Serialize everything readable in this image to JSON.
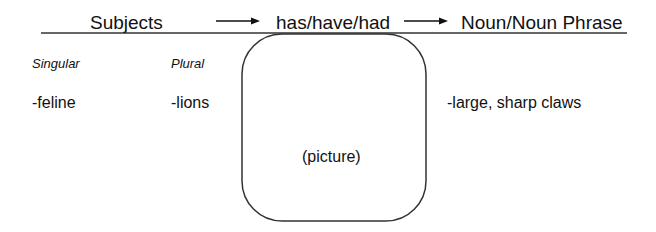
{
  "header": {
    "subjects_label": "Subjects",
    "verb_label": "has/have/had",
    "noun_label": "Noun/Noun Phrase",
    "arrow_icon": "right-arrow"
  },
  "subjects": {
    "singular": {
      "label": "Singular",
      "items": [
        "-feline"
      ]
    },
    "plural": {
      "label": "Plural",
      "items": [
        "-lions"
      ]
    }
  },
  "picture_box": {
    "label": "(picture)"
  },
  "noun_phrases": {
    "items": [
      "-large, sharp claws"
    ]
  },
  "colors": {
    "line": "#333333",
    "text": "#111111",
    "background": "#ffffff"
  }
}
